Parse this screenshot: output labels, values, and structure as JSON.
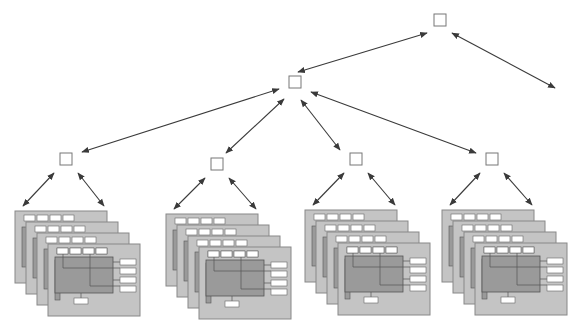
{
  "diagram": {
    "type": "hierarchy-tree",
    "colors": {
      "background": "#ffffff",
      "node_stroke": "#777777",
      "arrow": "#3a3a3a",
      "frame_fill": "#c4c4c4",
      "frame_stroke": "#888888",
      "panel_fill": "#9a9a9a",
      "panel_stroke": "#555555",
      "widget_fill": "#ffffff",
      "widget_stroke": "#666666"
    },
    "nodes": [
      {
        "id": "root",
        "x": 440,
        "y": 20
      },
      {
        "id": "level1",
        "x": 295,
        "y": 82
      },
      {
        "id": "leaf-1",
        "x": 66,
        "y": 159
      },
      {
        "id": "leaf-2",
        "x": 217,
        "y": 164
      },
      {
        "id": "leaf-3",
        "x": 356,
        "y": 159
      },
      {
        "id": "leaf-4",
        "x": 492,
        "y": 159
      }
    ],
    "edges": [
      {
        "from": [
          427,
          33
        ],
        "to": [
          298,
          72
        ],
        "bidirectional": true
      },
      {
        "from": [
          452,
          33
        ],
        "to": [
          555,
          88
        ],
        "bidirectional": true
      },
      {
        "from": [
          279,
          89
        ],
        "to": [
          82,
          152
        ],
        "bidirectional": true
      },
      {
        "from": [
          284,
          99
        ],
        "to": [
          226,
          153
        ],
        "bidirectional": true
      },
      {
        "from": [
          301,
          100
        ],
        "to": [
          340,
          150
        ],
        "bidirectional": true
      },
      {
        "from": [
          311,
          92
        ],
        "to": [
          476,
          153
        ],
        "bidirectional": true
      },
      {
        "from": [
          54,
          173
        ],
        "to": [
          23,
          206
        ],
        "bidirectional": true
      },
      {
        "from": [
          78,
          173
        ],
        "to": [
          104,
          206
        ],
        "bidirectional": true
      },
      {
        "from": [
          205,
          178
        ],
        "to": [
          174,
          209
        ],
        "bidirectional": true
      },
      {
        "from": [
          229,
          178
        ],
        "to": [
          256,
          209
        ],
        "bidirectional": true
      },
      {
        "from": [
          344,
          173
        ],
        "to": [
          313,
          205
        ],
        "bidirectional": true
      },
      {
        "from": [
          368,
          173
        ],
        "to": [
          395,
          205
        ],
        "bidirectional": true
      },
      {
        "from": [
          480,
          173
        ],
        "to": [
          450,
          205
        ],
        "bidirectional": true
      },
      {
        "from": [
          504,
          173
        ],
        "to": [
          532,
          205
        ],
        "bidirectional": true
      }
    ],
    "stacks": [
      {
        "id": "stack-1",
        "x": 15,
        "y": 211
      },
      {
        "id": "stack-2",
        "x": 166,
        "y": 214
      },
      {
        "id": "stack-3",
        "x": 305,
        "y": 210
      },
      {
        "id": "stack-4",
        "x": 442,
        "y": 210
      }
    ],
    "stack_frames": 4,
    "frame_offset": [
      11,
      11
    ],
    "frame_size": [
      92,
      72
    ]
  }
}
